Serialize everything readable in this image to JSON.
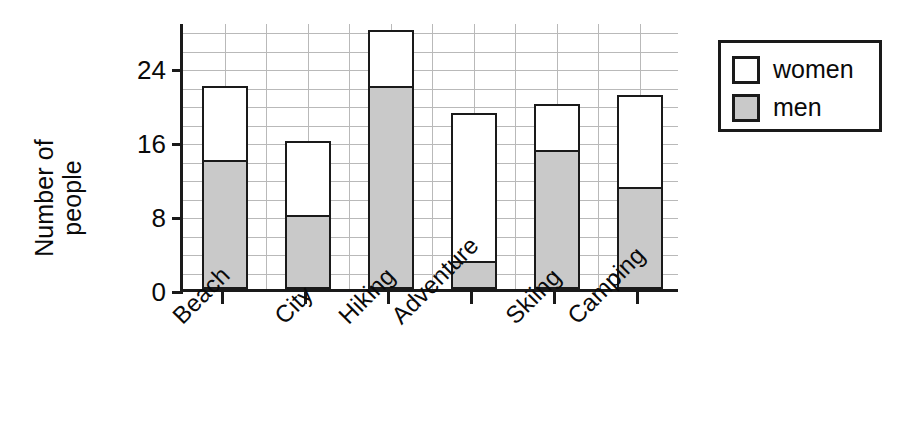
{
  "chart_data": {
    "type": "bar",
    "subtype": "stacked-bar",
    "title": "",
    "xlabel": "",
    "ylabel": "Number of people",
    "ylabel_lines": [
      "Number of",
      "people"
    ],
    "categories": [
      "Beach",
      "City",
      "Hiking",
      "Adventure",
      "Skiing",
      "Camping"
    ],
    "series": [
      {
        "name": "men",
        "values": [
          14,
          8,
          22,
          3,
          15,
          11
        ],
        "color": "#c9c9c9"
      },
      {
        "name": "women",
        "values": [
          8,
          8,
          6,
          16,
          5,
          10
        ],
        "color": "#ffffff"
      }
    ],
    "totals": [
      22,
      16,
      28,
      19,
      20,
      21
    ],
    "ylim": [
      0,
      29
    ],
    "y_major_ticks": [
      0,
      8,
      16,
      24
    ],
    "y_tick_labels": [
      "0",
      "8",
      "16",
      "24"
    ],
    "y_minor_step": 2,
    "grid": true,
    "grid_vertical_count": 12,
    "legend": {
      "position": "top-right",
      "entries": [
        {
          "label": "women",
          "swatch": "white-square"
        },
        {
          "label": "men",
          "swatch": "gray-square"
        }
      ]
    },
    "axis_color": "#1a1a1a",
    "grid_color": "#b9b9b9",
    "background": "#ffffff",
    "xtick_label_rotation": -45
  }
}
